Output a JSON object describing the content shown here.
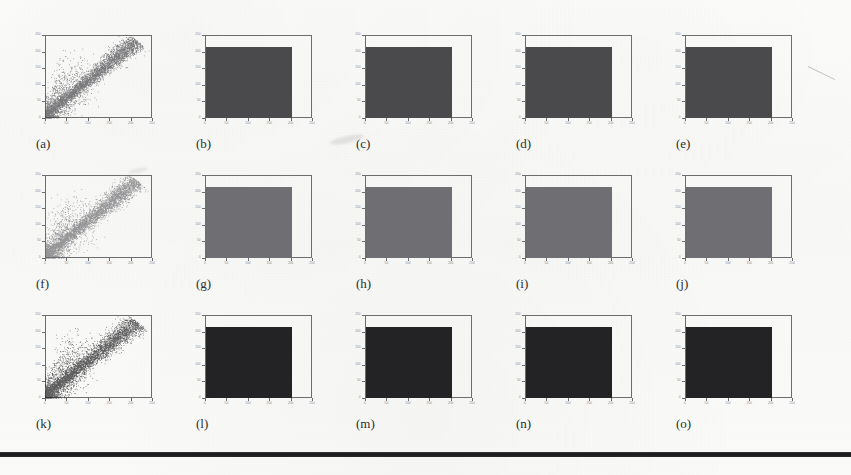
{
  "figure": {
    "kind": "scanned-figure-grid",
    "rows": 3,
    "columns": 5,
    "background_color": "#fbfbfa",
    "axis_color": "#6d6d70",
    "caption_color": "#2e2e30",
    "bottom_rule_color": "#1d1d1f"
  },
  "chart_data": [
    {
      "id": "a",
      "caption": "(a)",
      "type": "scatter",
      "row": 1,
      "column": 1,
      "title": "",
      "xlabel": "",
      "ylabel": "",
      "xlim": [
        0,
        250
      ],
      "ylim": [
        0,
        250
      ],
      "xticks": [
        0,
        50,
        100,
        150,
        200,
        250
      ],
      "yticks": [
        0,
        50,
        100,
        150,
        200,
        250
      ],
      "xticklabels": [
        "0",
        "50",
        "100",
        "150",
        "200",
        "250"
      ],
      "yticklabels": [
        "0",
        "50",
        "100",
        "150",
        "200",
        "250"
      ],
      "grid": false,
      "legend": "none",
      "point_color": "#4a4a4d",
      "point_count": 6000,
      "description": "Dense elongated diagonal cloud rising from lower-left to upper-right with a fan of sparse points spreading left and below the main ridge.",
      "cluster": {
        "ridge_slope": 1.05,
        "ridge_intercept": 8,
        "ridge_spread": 14,
        "fan_fraction": 0.3
      }
    },
    {
      "id": "b",
      "caption": "(b)",
      "type": "heatmap",
      "row": 1,
      "column": 2,
      "title": "",
      "xlabel": "",
      "ylabel": "",
      "xlim": [
        0,
        250
      ],
      "ylim": [
        0,
        250
      ],
      "xticks": [
        0,
        50,
        100,
        150,
        200,
        250
      ],
      "yticks": [
        0,
        50,
        100,
        150,
        200,
        250
      ],
      "xticklabels": [
        "0",
        "50",
        "100",
        "150",
        "200",
        "250"
      ],
      "yticklabels": [
        "0",
        "50",
        "100",
        "150",
        "200",
        "250"
      ],
      "grid": false,
      "legend": "none",
      "fill_color": "#4a4a4d",
      "fill_extent": {
        "x0": 0,
        "x1": 200,
        "y0": 0,
        "y1": 215
      },
      "description": "Uniformly saturated dark rectangular region covering roughly the lower-left 80% of the axes."
    },
    {
      "id": "c",
      "caption": "(c)",
      "type": "heatmap",
      "row": 1,
      "column": 3,
      "title": "",
      "xlabel": "",
      "ylabel": "",
      "xlim": [
        0,
        250
      ],
      "ylim": [
        0,
        250
      ],
      "xticks": [
        0,
        50,
        100,
        150,
        200,
        250
      ],
      "yticks": [
        0,
        50,
        100,
        150,
        200,
        250
      ],
      "xticklabels": [
        "0",
        "50",
        "100",
        "150",
        "200",
        "250"
      ],
      "yticklabels": [
        "0",
        "50",
        "100",
        "150",
        "200",
        "250"
      ],
      "grid": false,
      "legend": "none",
      "fill_color": "#4a4a4d",
      "fill_extent": {
        "x0": 0,
        "x1": 200,
        "y0": 0,
        "y1": 215
      },
      "description": "Uniformly saturated dark rectangular region, same density as (b)."
    },
    {
      "id": "d",
      "caption": "(d)",
      "type": "heatmap",
      "row": 1,
      "column": 4,
      "title": "",
      "xlabel": "",
      "ylabel": "",
      "xlim": [
        0,
        250
      ],
      "ylim": [
        0,
        250
      ],
      "xticks": [
        0,
        50,
        100,
        150,
        200,
        250
      ],
      "yticks": [
        0,
        50,
        100,
        150,
        200,
        250
      ],
      "xticklabels": [
        "0",
        "50",
        "100",
        "150",
        "200",
        "250"
      ],
      "yticklabels": [
        "0",
        "50",
        "100",
        "150",
        "200",
        "250"
      ],
      "grid": false,
      "legend": "none",
      "fill_color": "#4a4a4d",
      "fill_extent": {
        "x0": 0,
        "x1": 200,
        "y0": 0,
        "y1": 215
      },
      "description": "Uniformly saturated dark rectangular region, same density as (b)."
    },
    {
      "id": "e",
      "caption": "(e)",
      "type": "heatmap",
      "row": 1,
      "column": 5,
      "title": "",
      "xlabel": "",
      "ylabel": "",
      "xlim": [
        0,
        250
      ],
      "ylim": [
        0,
        250
      ],
      "xticks": [
        0,
        50,
        100,
        150,
        200,
        250
      ],
      "yticks": [
        0,
        50,
        100,
        150,
        200,
        250
      ],
      "xticklabels": [
        "0",
        "50",
        "100",
        "150",
        "200",
        "250"
      ],
      "yticklabels": [
        "0",
        "50",
        "100",
        "150",
        "200",
        "250"
      ],
      "grid": false,
      "legend": "none",
      "fill_color": "#4a4a4d",
      "fill_extent": {
        "x0": 0,
        "x1": 200,
        "y0": 0,
        "y1": 215
      },
      "description": "Uniformly saturated dark rectangular region, same density as (b)."
    },
    {
      "id": "f",
      "caption": "(f)",
      "type": "scatter",
      "row": 2,
      "column": 1,
      "title": "",
      "xlabel": "",
      "ylabel": "",
      "xlim": [
        0,
        250
      ],
      "ylim": [
        0,
        250
      ],
      "xticks": [
        0,
        50,
        100,
        150,
        200,
        250
      ],
      "yticks": [
        0,
        50,
        100,
        150,
        200,
        250
      ],
      "xticklabels": [
        "0",
        "50",
        "100",
        "150",
        "200",
        "250"
      ],
      "yticklabels": [
        "0",
        "50",
        "100",
        "150",
        "200",
        "250"
      ],
      "grid": false,
      "legend": "none",
      "point_color": "#6f6f73",
      "point_count": 6000,
      "description": "Same diagonal ridge structure as (a) but rendered in a lighter mid-grey tone with a small dense blob at the lower-left corner.",
      "cluster": {
        "ridge_slope": 1.05,
        "ridge_intercept": 8,
        "ridge_spread": 15,
        "fan_fraction": 0.32
      }
    },
    {
      "id": "g",
      "caption": "(g)",
      "type": "heatmap",
      "row": 2,
      "column": 2,
      "title": "",
      "xlabel": "",
      "ylabel": "",
      "xlim": [
        0,
        250
      ],
      "ylim": [
        0,
        250
      ],
      "xticks": [
        0,
        50,
        100,
        150,
        200,
        250
      ],
      "yticks": [
        0,
        50,
        100,
        150,
        200,
        250
      ],
      "xticklabels": [
        "0",
        "50",
        "100",
        "150",
        "200",
        "250"
      ],
      "yticklabels": [
        "0",
        "50",
        "100",
        "150",
        "200",
        "250"
      ],
      "grid": false,
      "legend": "none",
      "fill_color": "#6f6f73",
      "fill_extent": {
        "x0": 0,
        "x1": 200,
        "y0": 0,
        "y1": 215
      },
      "description": "Uniform mid-grey rectangular region, lighter than row 1."
    },
    {
      "id": "h",
      "caption": "(h)",
      "type": "heatmap",
      "row": 2,
      "column": 3,
      "title": "",
      "xlabel": "",
      "ylabel": "",
      "xlim": [
        0,
        250
      ],
      "ylim": [
        0,
        250
      ],
      "xticks": [
        0,
        50,
        100,
        150,
        200,
        250
      ],
      "yticks": [
        0,
        50,
        100,
        150,
        200,
        250
      ],
      "xticklabels": [
        "0",
        "50",
        "100",
        "150",
        "200",
        "250"
      ],
      "yticklabels": [
        "0",
        "50",
        "100",
        "150",
        "200",
        "250"
      ],
      "grid": false,
      "legend": "none",
      "fill_color": "#6f6f73",
      "fill_extent": {
        "x0": 0,
        "x1": 200,
        "y0": 0,
        "y1": 215
      },
      "description": "Uniform mid-grey rectangular region, same tone as (g)."
    },
    {
      "id": "i",
      "caption": "(i)",
      "type": "heatmap",
      "row": 2,
      "column": 4,
      "title": "",
      "xlabel": "",
      "ylabel": "",
      "xlim": [
        0,
        250
      ],
      "ylim": [
        0,
        250
      ],
      "xticks": [
        0,
        50,
        100,
        150,
        200,
        250
      ],
      "yticks": [
        0,
        50,
        100,
        150,
        200,
        250
      ],
      "xticklabels": [
        "0",
        "50",
        "100",
        "150",
        "200",
        "250"
      ],
      "yticklabels": [
        "0",
        "50",
        "100",
        "150",
        "200",
        "250"
      ],
      "grid": false,
      "legend": "none",
      "fill_color": "#6f6f73",
      "fill_extent": {
        "x0": 0,
        "x1": 200,
        "y0": 0,
        "y1": 215
      },
      "description": "Uniform mid-grey rectangular region, same tone as (g)."
    },
    {
      "id": "j",
      "caption": "(j)",
      "type": "heatmap",
      "row": 2,
      "column": 5,
      "title": "",
      "xlabel": "",
      "ylabel": "",
      "xlim": [
        0,
        250
      ],
      "ylim": [
        0,
        250
      ],
      "xticks": [
        0,
        50,
        100,
        150,
        200,
        250
      ],
      "yticks": [
        0,
        50,
        100,
        150,
        200,
        250
      ],
      "xticklabels": [
        "0",
        "50",
        "100",
        "150",
        "200",
        "250"
      ],
      "yticklabels": [
        "0",
        "50",
        "100",
        "150",
        "200",
        "250"
      ],
      "grid": false,
      "legend": "none",
      "fill_color": "#6f6f73",
      "fill_extent": {
        "x0": 0,
        "x1": 200,
        "y0": 0,
        "y1": 215
      },
      "description": "Uniform mid-grey rectangular region, same tone as (g)."
    },
    {
      "id": "k",
      "caption": "(k)",
      "type": "scatter",
      "row": 3,
      "column": 1,
      "title": "",
      "xlabel": "",
      "ylabel": "",
      "xlim": [
        0,
        250
      ],
      "ylim": [
        0,
        250
      ],
      "xticks": [
        0,
        50,
        100,
        150,
        200,
        250
      ],
      "yticks": [
        0,
        50,
        100,
        150,
        200,
        250
      ],
      "xticklabels": [
        "0",
        "50",
        "100",
        "150",
        "200",
        "250"
      ],
      "yticklabels": [
        "0",
        "50",
        "100",
        "150",
        "200",
        "250"
      ],
      "grid": false,
      "legend": "none",
      "point_color": "#232326",
      "point_count": 6000,
      "description": "Same diagonal ridge structure as (a) rendered in the darkest, near-black tone with a wide sparse fan to the left.",
      "cluster": {
        "ridge_slope": 1.02,
        "ridge_intercept": 10,
        "ridge_spread": 16,
        "fan_fraction": 0.34
      }
    },
    {
      "id": "l",
      "caption": "(l)",
      "type": "heatmap",
      "row": 3,
      "column": 2,
      "title": "",
      "xlabel": "",
      "ylabel": "",
      "xlim": [
        0,
        250
      ],
      "ylim": [
        0,
        250
      ],
      "xticks": [
        0,
        50,
        100,
        150,
        200,
        250
      ],
      "yticks": [
        0,
        50,
        100,
        150,
        200,
        250
      ],
      "xticklabels": [
        "0",
        "50",
        "100",
        "150",
        "200",
        "250"
      ],
      "yticklabels": [
        "0",
        "50",
        "100",
        "150",
        "200",
        "250"
      ],
      "grid": false,
      "legend": "none",
      "fill_color": "#232326",
      "fill_extent": {
        "x0": 0,
        "x1": 200,
        "y0": 0,
        "y1": 215
      },
      "description": "Near-black saturated rectangular region, the darkest row."
    },
    {
      "id": "m",
      "caption": "(m)",
      "type": "heatmap",
      "row": 3,
      "column": 3,
      "title": "",
      "xlabel": "",
      "ylabel": "",
      "xlim": [
        0,
        250
      ],
      "ylim": [
        0,
        250
      ],
      "xticks": [
        0,
        50,
        100,
        150,
        200,
        250
      ],
      "yticks": [
        0,
        50,
        100,
        150,
        200,
        250
      ],
      "xticklabels": [
        "0",
        "50",
        "100",
        "150",
        "200",
        "250"
      ],
      "yticklabels": [
        "0",
        "50",
        "100",
        "150",
        "200",
        "250"
      ],
      "grid": false,
      "legend": "none",
      "fill_color": "#232326",
      "fill_extent": {
        "x0": 0,
        "x1": 200,
        "y0": 0,
        "y1": 215
      },
      "description": "Near-black saturated rectangular region, same tone as (l)."
    },
    {
      "id": "n",
      "caption": "(n)",
      "type": "heatmap",
      "row": 3,
      "column": 4,
      "title": "",
      "xlabel": "",
      "ylabel": "",
      "xlim": [
        0,
        250
      ],
      "ylim": [
        0,
        250
      ],
      "xticks": [
        0,
        50,
        100,
        150,
        200,
        250
      ],
      "yticks": [
        0,
        50,
        100,
        150,
        200,
        250
      ],
      "xticklabels": [
        "0",
        "50",
        "100",
        "150",
        "200",
        "250"
      ],
      "yticklabels": [
        "0",
        "50",
        "100",
        "150",
        "200",
        "250"
      ],
      "grid": false,
      "legend": "none",
      "fill_color": "#232326",
      "fill_extent": {
        "x0": 0,
        "x1": 200,
        "y0": 0,
        "y1": 215
      },
      "description": "Near-black saturated rectangular region, same tone as (l)."
    },
    {
      "id": "o",
      "caption": "(o)",
      "type": "heatmap",
      "row": 3,
      "column": 5,
      "title": "",
      "xlabel": "",
      "ylabel": "",
      "xlim": [
        0,
        250
      ],
      "ylim": [
        0,
        250
      ],
      "xticks": [
        0,
        50,
        100,
        150,
        200,
        250
      ],
      "yticks": [
        0,
        50,
        100,
        150,
        200,
        250
      ],
      "xticklabels": [
        "0",
        "50",
        "100",
        "150",
        "200",
        "250"
      ],
      "yticklabels": [
        "0",
        "50",
        "100",
        "150",
        "200",
        "250"
      ],
      "grid": false,
      "legend": "none",
      "fill_color": "#232326",
      "fill_extent": {
        "x0": 0,
        "x1": 200,
        "y0": 0,
        "y1": 215
      },
      "description": "Near-black saturated rectangular region, same tone as (l)."
    }
  ]
}
